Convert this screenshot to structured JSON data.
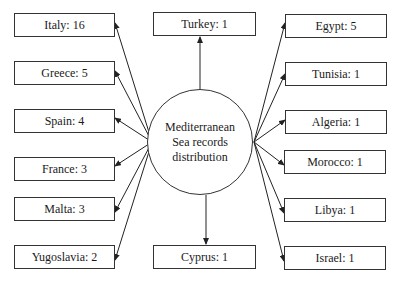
{
  "center": {
    "lines": [
      "Mediterranean",
      "Sea records",
      "distribution"
    ]
  },
  "top": {
    "label": "Turkey: 1"
  },
  "bottom": {
    "label": "Cyprus: 1"
  },
  "left": [
    {
      "label": "Italy: 16"
    },
    {
      "label": "Greece: 5"
    },
    {
      "label": "Spain: 4"
    },
    {
      "label": "France: 3"
    },
    {
      "label": "Malta: 3"
    },
    {
      "label": "Yugoslavia: 2"
    }
  ],
  "right": [
    {
      "label": "Egypt: 5"
    },
    {
      "label": "Tunisia: 1"
    },
    {
      "label": "Algeria: 1"
    },
    {
      "label": "Morocco: 1"
    },
    {
      "label": "Libya: 1"
    },
    {
      "label": "Israel: 1"
    }
  ],
  "colors": {
    "stroke": "#333333",
    "text": "#1a1a1a",
    "background": "#ffffff"
  }
}
